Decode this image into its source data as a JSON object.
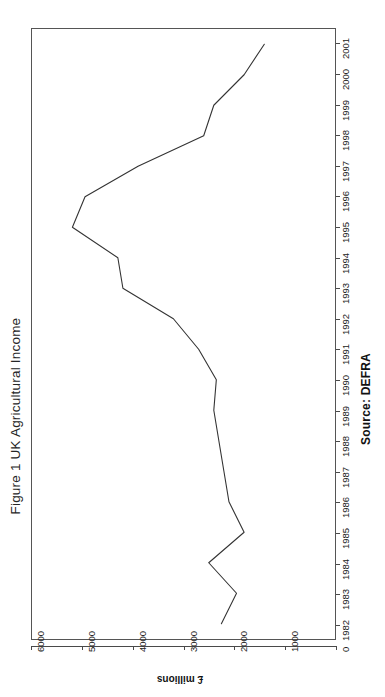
{
  "figure": {
    "title": "Figure 1 UK Agricultural Income",
    "source_note": "Source: DEFRA"
  },
  "chart_data": {
    "type": "line",
    "title": "Figure 1 UK Agricultural Income",
    "orientation": "rotated-90-ccw",
    "xlabel": "",
    "ylabel": "£ millions",
    "ylim": [
      0,
      6000
    ],
    "ytick_labels": [
      "6000",
      "5000",
      "4000",
      "3000",
      "2000",
      "1000",
      "0"
    ],
    "yticks": [
      6000,
      5000,
      4000,
      3000,
      2000,
      1000,
      0
    ],
    "grid": false,
    "legend": "none",
    "categories": [
      "1982",
      "1983",
      "1984",
      "1985",
      "1986",
      "1987",
      "1988",
      "1989",
      "1990",
      "1991",
      "1992",
      "1993",
      "1994",
      "1995",
      "1996",
      "1997",
      "1998",
      "1999",
      "2000",
      "2001"
    ],
    "series": [
      {
        "name": "UK Agricultural Income",
        "values": [
          2250,
          1950,
          2500,
          1800,
          2100,
          2200,
          2300,
          2400,
          2350,
          2700,
          3200,
          4200,
          4300,
          5200,
          4950,
          3900,
          2600,
          2400,
          1800,
          1400
        ]
      }
    ],
    "annotations": [
      "Source: DEFRA"
    ]
  }
}
